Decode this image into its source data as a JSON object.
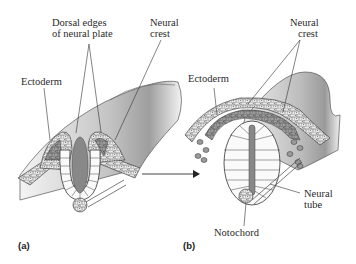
{
  "figure": {
    "panels": [
      {
        "id": "a",
        "panel_label": "(a)",
        "labels": {
          "dorsal_edges_line1": "Dorsal edges",
          "dorsal_edges_line2": "of neural plate",
          "neural_crest_line1": "Neural",
          "neural_crest_line2": "crest",
          "ectoderm": "Ectoderm"
        }
      },
      {
        "id": "b",
        "panel_label": "(b)",
        "labels": {
          "neural_crest_line1": "Neural",
          "neural_crest_line2": "crest",
          "ectoderm": "Ectoderm",
          "neural_tube_line1": "Neural",
          "neural_tube_line2": "tube",
          "notochord": "Notochord"
        }
      }
    ],
    "arrow": "right-arrow",
    "colors": {
      "lumen": "#8a8a8a",
      "crest_cells": "#9a9a9a",
      "ectoderm_cells": "#d8d8d8",
      "surface_shade": "#bdbdbd",
      "line": "#333333"
    }
  }
}
